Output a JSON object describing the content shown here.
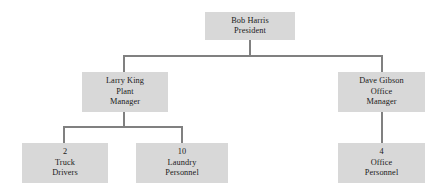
{
  "chart": {
    "type": "org-chart",
    "canvas": {
      "width": 444,
      "height": 192,
      "background": "#ffffff"
    },
    "style": {
      "box_fill": "#d8d8d8",
      "connector_color": "#808080",
      "text_color": "#1a1a1a"
    },
    "nodes": [
      {
        "id": "president",
        "level": 0,
        "lines": [
          "Bob Harris",
          "President"
        ],
        "name": "Bob Harris",
        "role": "President",
        "count": null,
        "box": {
          "x": 205,
          "y": 12,
          "w": 90,
          "h": 28
        }
      },
      {
        "id": "plant-manager",
        "level": 1,
        "lines": [
          "Larry King",
          "Plant",
          "Manager"
        ],
        "name": "Larry King",
        "role": "Plant Manager",
        "count": null,
        "box": {
          "x": 82,
          "y": 72,
          "w": 86,
          "h": 40
        }
      },
      {
        "id": "office-manager",
        "level": 1,
        "lines": [
          "Dave Gibson",
          "Office",
          "Manager"
        ],
        "name": "Dave Gibson",
        "role": "Office Manager",
        "count": null,
        "box": {
          "x": 338,
          "y": 72,
          "w": 87,
          "h": 40
        }
      },
      {
        "id": "truck-drivers",
        "level": 2,
        "lines": [
          "2",
          "Truck",
          "Drivers"
        ],
        "name": null,
        "role": "Truck Drivers",
        "count": "2",
        "box": {
          "x": 22,
          "y": 143,
          "w": 86,
          "h": 40
        }
      },
      {
        "id": "laundry-personnel",
        "level": 2,
        "lines": [
          "10",
          "Laundry",
          "Personnel"
        ],
        "name": null,
        "role": "Laundry Personnel",
        "count": "10",
        "box": {
          "x": 136,
          "y": 143,
          "w": 92,
          "h": 40
        }
      },
      {
        "id": "office-personnel",
        "level": 2,
        "lines": [
          "4",
          "Office",
          "Personnel"
        ],
        "name": null,
        "role": "Office Personnel",
        "count": "4",
        "box": {
          "x": 338,
          "y": 143,
          "w": 87,
          "h": 40
        }
      }
    ],
    "edges": [
      {
        "from": "president",
        "to": "plant-manager"
      },
      {
        "from": "president",
        "to": "office-manager"
      },
      {
        "from": "plant-manager",
        "to": "truck-drivers"
      },
      {
        "from": "plant-manager",
        "to": "laundry-personnel"
      },
      {
        "from": "office-manager",
        "to": "office-personnel"
      }
    ],
    "connector_paths": [
      "M250,40 L250,56",
      "M124,56 L382,56",
      "M124,56 L124,72",
      "M382,56 L382,72",
      "M124,112 L124,127",
      "M64,127 L182,127",
      "M64,127 L64,143",
      "M182,127 L182,143",
      "M382,112 L382,143"
    ]
  }
}
